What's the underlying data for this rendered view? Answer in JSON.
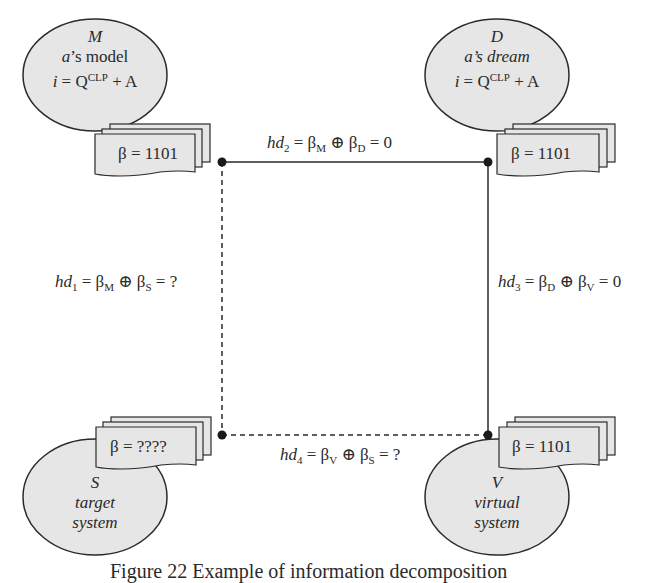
{
  "nodes": {
    "M": {
      "symbol": "M",
      "line1_italic": "a",
      "line1_rest": "’s model",
      "eq_i": "i",
      "eq_rest1": " = Q",
      "eq_sup": "CLP",
      "eq_rest2": " + A",
      "card": "β = 1101"
    },
    "D": {
      "symbol": "D",
      "line1": "a’s dream",
      "eq_i": "i",
      "eq_rest1": " = Q",
      "eq_sup": "CLP",
      "eq_rest2": " + A",
      "card": "β = 1101"
    },
    "S": {
      "symbol": "S",
      "line1": "target",
      "line2": "system",
      "card": "β = ????"
    },
    "V": {
      "symbol": "V",
      "line1": "virtual",
      "line2": "system",
      "card": "β = 1101"
    }
  },
  "edges": {
    "hd1": {
      "name": "hd",
      "sub": "1",
      "a": "β",
      "a_sub": "M",
      "op": " ⊕ ",
      "b": "β",
      "b_sub": "S",
      "result": " = ?",
      "style": "dashed"
    },
    "hd2": {
      "name": "hd",
      "sub": "2",
      "a": "β",
      "a_sub": "M",
      "op": " ⊕ ",
      "b": "β",
      "b_sub": "D",
      "result": " = 0",
      "style": "solid"
    },
    "hd3": {
      "name": "hd",
      "sub": "3",
      "a": "β",
      "a_sub": "D",
      "op": " ⊕ ",
      "b": "β",
      "b_sub": "V",
      "result": " = 0",
      "style": "solid"
    },
    "hd4": {
      "name": "hd",
      "sub": "4",
      "a": "β",
      "a_sub": "V",
      "op": " ⊕ ",
      "b": "β",
      "b_sub": "S",
      "result": " = ?",
      "style": "dashed"
    }
  },
  "caption": "Figure 22  Example of information decomposition",
  "colors": {
    "fill": "#e6e6e6",
    "stroke": "#2a2a2a",
    "background": "#ffffff"
  }
}
